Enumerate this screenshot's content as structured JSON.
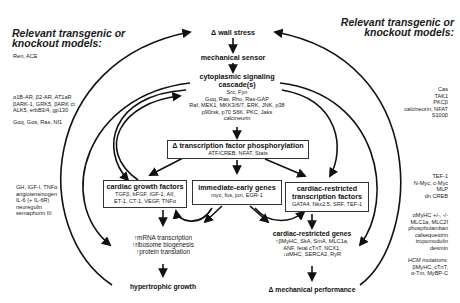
{
  "left_panel": {
    "heading_line1": "Relevant transgenic or",
    "heading_line2": "knockout models:",
    "groups": [
      [
        "Ren, ACE"
      ],
      [
        "α1B-AR, β2-AR, AT1aR",
        "βARK-1, GRK5, βARK ct",
        "ALK5, erbB3/4, gp130"
      ],
      [
        "Gαq, Gαs, Ras, Nf1"
      ],
      [
        "GH, IGF-I, TNFα",
        "angiotensinogen",
        "IL-6 (+ IL-6R)",
        "neuregulin",
        "semaphorin III"
      ]
    ]
  },
  "right_panel": {
    "heading_line1": "Relevant transgenic or",
    "heading_line2": "knockout models:",
    "groups": [
      [
        "Cas",
        "TAK1",
        "PKCβ",
        "calcineurin, NFAT",
        "S100β"
      ],
      [
        "TEF-1",
        "N-Myc, c-Myc",
        "MLP",
        "dn CREB"
      ],
      [
        "αMyHC +/-, -/-",
        "MLC1a, MLC2f",
        "phospholamban",
        "calsequestrin",
        "tropomodulin",
        "desmin"
      ],
      [
        "HCM mutations:",
        "βMyHC, cTnT,",
        "α-Tm, MyBP-C"
      ]
    ]
  },
  "nodes": {
    "wall_stress": "Δ wall stress",
    "mechanical_sensor": "mechanical sensor",
    "cytoplasmic": {
      "title_line1": "cytoplasmic signaling",
      "title_line2": "cascade(s)",
      "lines": [
        "Src, Fyn",
        "Gαq, Ras, Rho, Ras-GAP",
        "Raf, MEK1, MKK3/6/7, ERK, JNK, p38",
        "p90rsk, p70 S6K, PKC, Jaks",
        "calcineurin"
      ]
    },
    "tf_phosphorylation": {
      "title": "Δ transcription factor phosphorylation",
      "sub": "ATF/CREB, NFAT, Stats"
    },
    "growth_factors": {
      "title": "cardiac growth factors",
      "lines": [
        "TGFβ, bFGF, IGF-1, AII,",
        "ET-1, CT-1, VEGF, TNFα"
      ]
    },
    "immediate_early": {
      "title": "immediate-early genes",
      "sub": "myc, fos, jun, EGR-1"
    },
    "cardiac_tf": {
      "title_line1": "cardiac-restricted",
      "title_line2": "transcription factors",
      "sub": "GATA4, Nkx2.5, SRF, TEF-1"
    },
    "translation": [
      "↑mRNA transcription",
      "↑ribosome biogenesis",
      "↑protein translation"
    ],
    "hypertrophic_growth": "hypertrophic growth",
    "cardiac_genes": {
      "title": "cardiac-restricted genes",
      "lines": [
        "↑βMyHC, SkA, SmA, MLC1a,",
        "ANF, fetal cTnT, NCX1;",
        "↓αMHC, SERCA2, RyR"
      ]
    },
    "mechanical_performance": "Δ mechanical performance"
  }
}
